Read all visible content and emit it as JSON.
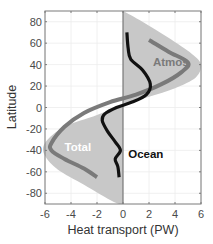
{
  "chart_data": {
    "type": "line",
    "title": "",
    "xlabel": "Heat transport (PW)",
    "ylabel": "Latitude",
    "xlim": [
      -6,
      6
    ],
    "ylim": [
      -90,
      90
    ],
    "xticks": [
      -6,
      -4,
      -2,
      0,
      2,
      4,
      6
    ],
    "yticks": [
      80,
      60,
      40,
      20,
      0,
      -20,
      -40,
      -60,
      -80
    ],
    "grid": true,
    "legend": "none (inline annotations)",
    "series": [
      {
        "name": "Total",
        "style": "shaded band",
        "color": "#c8c8c8",
        "label_color": "#ffffff",
        "envelope": [
          {
            "x": 0,
            "y": 90
          },
          {
            "x": 1.5,
            "y": 80
          },
          {
            "x": 3.5,
            "y": 65
          },
          {
            "x": 5.3,
            "y": 50
          },
          {
            "x": 6,
            "y": 40
          },
          {
            "x": 5.6,
            "y": 28
          },
          {
            "x": 4,
            "y": 18
          },
          {
            "x": 2,
            "y": 10
          },
          {
            "x": 0,
            "y": 3
          },
          {
            "x": -2,
            "y": -7
          },
          {
            "x": -4.5,
            "y": -18
          },
          {
            "x": -6,
            "y": -33
          },
          {
            "x": -6,
            "y": -45
          },
          {
            "x": -5,
            "y": -58
          },
          {
            "x": -3,
            "y": -72
          },
          {
            "x": -0.7,
            "y": -88
          },
          {
            "x": 0,
            "y": -90
          }
        ]
      },
      {
        "name": "Atmos",
        "style": "thick gray line",
        "color": "#7a7a7a",
        "points": [
          {
            "x": 2,
            "y": 63
          },
          {
            "x": 3.5,
            "y": 52
          },
          {
            "x": 5,
            "y": 42
          },
          {
            "x": 4.5,
            "y": 33
          },
          {
            "x": 3,
            "y": 22
          },
          {
            "x": 1,
            "y": 12
          },
          {
            "x": -1,
            "y": 5
          },
          {
            "x": -3,
            "y": -5
          },
          {
            "x": -4.5,
            "y": -18
          },
          {
            "x": -5.5,
            "y": -33
          },
          {
            "x": -5.5,
            "y": -40
          },
          {
            "x": -4.5,
            "y": -48
          },
          {
            "x": -3,
            "y": -57
          },
          {
            "x": -2,
            "y": -65
          }
        ]
      },
      {
        "name": "Ocean",
        "style": "thick black line",
        "color": "#111111",
        "points": [
          {
            "x": 0.3,
            "y": 70
          },
          {
            "x": 0.4,
            "y": 55
          },
          {
            "x": 0.6,
            "y": 45
          },
          {
            "x": 1.5,
            "y": 35
          },
          {
            "x": 2.1,
            "y": 22
          },
          {
            "x": 1.8,
            "y": 12
          },
          {
            "x": 0.7,
            "y": 5
          },
          {
            "x": -0.5,
            "y": 0
          },
          {
            "x": -1.4,
            "y": -6
          },
          {
            "x": -1.6,
            "y": -12
          },
          {
            "x": -1.2,
            "y": -22
          },
          {
            "x": -0.6,
            "y": -32
          },
          {
            "x": -0.2,
            "y": -40
          },
          {
            "x": -0.6,
            "y": -48
          },
          {
            "x": -0.4,
            "y": -55
          },
          {
            "x": -0.3,
            "y": -65
          }
        ]
      }
    ],
    "annotations": [
      {
        "text": "Atmos",
        "x": 2.3,
        "y": 42
      },
      {
        "text": "Total",
        "x": -4.5,
        "y": -37
      },
      {
        "text": "Ocean",
        "x": 0.4,
        "y": -43
      }
    ]
  }
}
